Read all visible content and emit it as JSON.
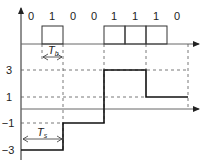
{
  "bits": [
    "0",
    "1",
    "0",
    "0",
    "1",
    "1",
    "1",
    "0"
  ],
  "levels": {
    "l3": "3",
    "l1": "1",
    "lm1": "−1",
    "lm3": "−3"
  },
  "annotations": {
    "tb_main": "T",
    "tb_sub": "b",
    "ts_main": "T",
    "ts_sub": "s"
  },
  "colors": {
    "line": "#222222",
    "dash": "#555555",
    "signal": "#111111"
  },
  "signal_values": [
    -3,
    -1,
    3,
    1
  ]
}
